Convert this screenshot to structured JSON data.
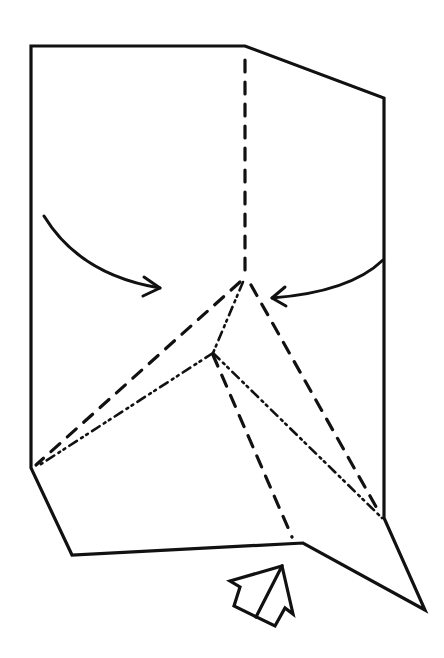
{
  "diagram": {
    "type": "origami-folding-step",
    "colors": {
      "line": "#111111",
      "background": "#ffffff"
    },
    "paper_outline": {
      "points": [
        [
          31,
          46
        ],
        [
          245,
          46
        ],
        [
          384,
          98
        ],
        [
          384,
          518
        ],
        [
          425,
          610
        ],
        [
          303,
          543
        ],
        [
          72,
          555
        ],
        [
          31,
          468
        ]
      ]
    },
    "valley_folds": [
      {
        "name": "center-vertical-valley",
        "from": [
          245,
          60
        ],
        "to": [
          245,
          272
        ]
      },
      {
        "name": "left-upper-valley",
        "from": [
          240,
          282
        ],
        "to": [
          36,
          465
        ]
      },
      {
        "name": "inner-valley",
        "from": [
          213,
          355
        ],
        "to": [
          292,
          537
        ]
      },
      {
        "name": "right-valley",
        "from": [
          251,
          285
        ],
        "to": [
          379,
          512
        ]
      }
    ],
    "mountain_folds": [
      {
        "name": "apex-to-inner-mountain",
        "from": [
          243,
          282
        ],
        "to": [
          213,
          353
        ]
      },
      {
        "name": "left-mountain",
        "from": [
          213,
          353
        ],
        "to": [
          38,
          466
        ]
      },
      {
        "name": "right-mountain",
        "from": [
          213,
          353
        ],
        "to": [
          382,
          518
        ]
      }
    ],
    "fold_arrows": [
      {
        "name": "left-fold-arrow",
        "path": "M44,216 Q80,275 160,288",
        "direction": "right"
      },
      {
        "name": "right-fold-arrow",
        "path": "M383,260 Q350,292 272,298",
        "direction": "left"
      }
    ],
    "push_arrow": {
      "name": "push-in-arrow",
      "direction": "up-right"
    }
  }
}
